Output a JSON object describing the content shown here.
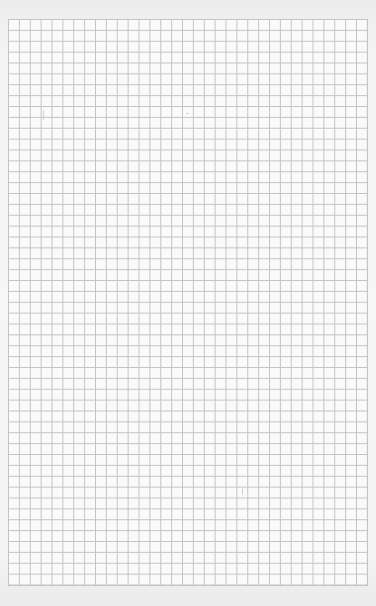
{
  "page": {
    "type": "graph-paper",
    "grid": {
      "columns": 33,
      "rows": 52,
      "cell_px": 10.88,
      "line_color": "#c4c4c4",
      "paper_color": "#fafafa"
    }
  }
}
